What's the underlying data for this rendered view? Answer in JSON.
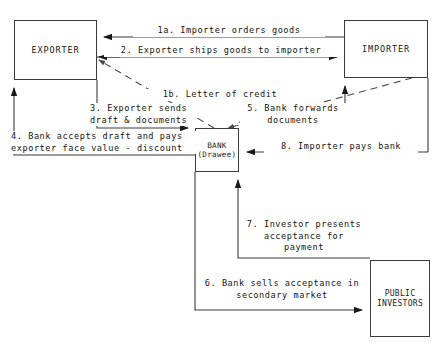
{
  "diagram": {
    "type": "process-flow",
    "stroke_color": "#3a3a3a",
    "text_color": "#151515",
    "background": "#ffffff",
    "nodes": [
      {
        "id": "exporter",
        "label": "EXPORTER"
      },
      {
        "id": "importer",
        "label": "IMPORTER"
      },
      {
        "id": "bank",
        "label": "BANK\n(Drawee)"
      },
      {
        "id": "public_investors",
        "label": "PUBLIC\nINVESTORS"
      }
    ],
    "edges": [
      {
        "id": "step-1a",
        "label": "1a. Importer orders goods",
        "from": "importer",
        "to": "exporter",
        "style": "solid"
      },
      {
        "id": "step-2",
        "label": "2. Exporter ships goods to importer",
        "from": "exporter",
        "to": "importer",
        "style": "solid"
      },
      {
        "id": "step-1b",
        "label": "1b. Letter of credit",
        "from": "importer",
        "to": "exporter",
        "style": "dashed"
      },
      {
        "id": "step-3",
        "label": "3. Exporter sends\ndraft & documents",
        "from": "exporter",
        "to": "bank",
        "style": "solid"
      },
      {
        "id": "step-4",
        "label": "4. Bank accepts draft and pays\nexporter face value - discount",
        "from": "bank",
        "to": "exporter",
        "style": "solid"
      },
      {
        "id": "step-5",
        "label": "5. Bank forwards\ndocuments",
        "from": "bank",
        "to": "importer",
        "style": "solid"
      },
      {
        "id": "step-6",
        "label": "6. Bank sells acceptance in\nsecondary market",
        "from": "bank",
        "to": "public_investors",
        "style": "solid"
      },
      {
        "id": "step-7",
        "label": "7. Investor presents\nacceptance for\npayment",
        "from": "public_investors",
        "to": "bank",
        "style": "solid"
      },
      {
        "id": "step-8",
        "label": "8. Importer pays bank",
        "from": "importer",
        "to": "bank",
        "style": "solid"
      }
    ]
  }
}
